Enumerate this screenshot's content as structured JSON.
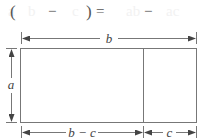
{
  "formula": {
    "open_paren": "(",
    "term1": "b",
    "minus1": "−",
    "term2": "c",
    "close_paren": ")",
    "equals": "=",
    "rhs1": "ab",
    "minus2": "−",
    "rhs2": "ac",
    "prefix": "a"
  },
  "diagram": {
    "top_label": "b",
    "side_label": "a",
    "bottom_left_label": "b − c",
    "bottom_right_label": "c"
  },
  "colors": {
    "line": "#6a6a6a",
    "text": "#444444"
  }
}
